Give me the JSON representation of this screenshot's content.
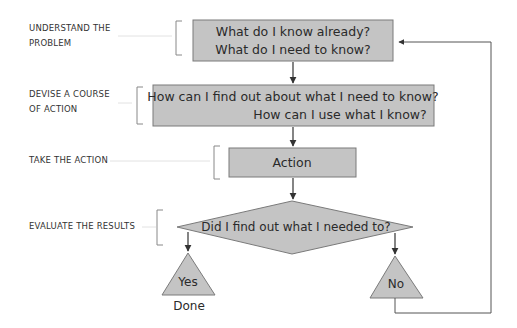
{
  "diagram": {
    "type": "flowchart",
    "colors": {
      "shape_fill": "#c4c4c4",
      "shape_stroke": "#7a7a7a",
      "line": "#555555",
      "bracket": "#888888",
      "text": "#2a2a2a"
    },
    "stages": [
      {
        "label_line1": "UNDERSTAND THE",
        "label_line2": "PROBLEM"
      },
      {
        "label_line1": "DEVISE A COURSE",
        "label_line2": "OF ACTION"
      },
      {
        "label_line1": "TAKE THE ACTION",
        "label_line2": ""
      },
      {
        "label_line1": "EVALUATE THE RESULTS",
        "label_line2": ""
      }
    ],
    "nodes": {
      "understand": {
        "line1": "What do I know already?",
        "line2": "What do I need to know?"
      },
      "devise": {
        "line1": "How can I find out about what I need to know?",
        "line2": "How can I use what I know?"
      },
      "action": {
        "text": "Action"
      },
      "evaluate": {
        "text": "Did I find out what I needed to?"
      },
      "yes": {
        "text": "Yes",
        "caption": "Done"
      },
      "no": {
        "text": "No"
      }
    }
  }
}
